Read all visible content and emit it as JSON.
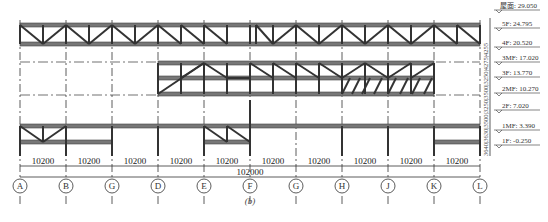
{
  "figure": {
    "caption": "(b)",
    "total_span": "102000",
    "bay_dimension": "10200",
    "axes": [
      "A",
      "B",
      "G",
      "D",
      "E",
      "F",
      "G",
      "H",
      "J",
      "K",
      "L"
    ],
    "bays": [
      "10200",
      "10200",
      "10200",
      "10200",
      "10200",
      "10200",
      "10200",
      "10200",
      "10200",
      "10200"
    ],
    "vertical_dimensions": "3640|3630|3500|3250|3500|3250|4275|4255",
    "levels": [
      {
        "label": "屋面: 29.050"
      },
      {
        "label": "5F: 24.795"
      },
      {
        "label": "4F: 20.520"
      },
      {
        "label": "3MF: 17.020"
      },
      {
        "label": "3F: 13.770"
      },
      {
        "label": "2MF: 10.270"
      },
      {
        "label": "2F: 7.020"
      },
      {
        "label": "1MF: 3.390"
      },
      {
        "label": "1F: -0.250"
      }
    ],
    "colors": {
      "member": "#555555",
      "line": "#222222",
      "gridline": "#333333"
    }
  }
}
